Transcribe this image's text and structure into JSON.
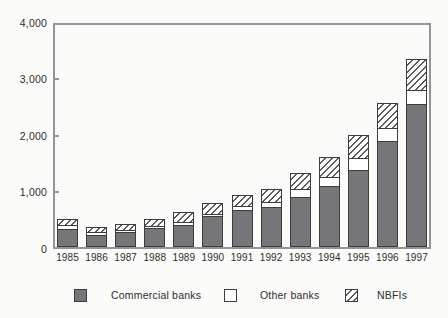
{
  "figure": {
    "background": "#fbfbf9",
    "axis_color": "#949494",
    "bar_border_color": "#3c3c3c",
    "text_color": "#2d2d2d"
  },
  "chart_data": {
    "type": "bar",
    "stacked": true,
    "title": "",
    "xlabel": "",
    "ylabel": "",
    "categories": [
      "1985",
      "1986",
      "1987",
      "1988",
      "1989",
      "1990",
      "1991",
      "1992",
      "1993",
      "1994",
      "1995",
      "1996",
      "1997"
    ],
    "series": [
      {
        "name": "Commercial banks",
        "style": "solid",
        "color": "#76767a",
        "values": [
          320,
          220,
          270,
          340,
          390,
          545,
          650,
          705,
          885,
          1075,
          1370,
          1880,
          2525
        ]
      },
      {
        "name": "Other banks",
        "style": "white",
        "color": "#fefefe",
        "values": [
          90,
          65,
          55,
          60,
          70,
          60,
          85,
          115,
          160,
          175,
          235,
          240,
          270
        ]
      },
      {
        "name": "NBFIs",
        "style": "hatch",
        "color": "#ffffff",
        "hatch_color": "#5a5a5a",
        "values": [
          130,
          115,
          120,
          135,
          190,
          205,
          220,
          255,
          295,
          380,
          425,
          465,
          570
        ]
      }
    ],
    "ylim": [
      0,
      4000
    ],
    "ytick_values": [
      0,
      1000,
      2000,
      3000,
      4000
    ],
    "ytick_labels": [
      "0",
      "1,000",
      "2,000",
      "3,000",
      "4,000"
    ],
    "grid": false,
    "legend_position": "bottom"
  },
  "legend": {
    "items": [
      {
        "label": "Commercial banks",
        "swatch": "solid"
      },
      {
        "label": "Other banks",
        "swatch": "white"
      },
      {
        "label": "NBFIs",
        "swatch": "hatch"
      }
    ]
  }
}
